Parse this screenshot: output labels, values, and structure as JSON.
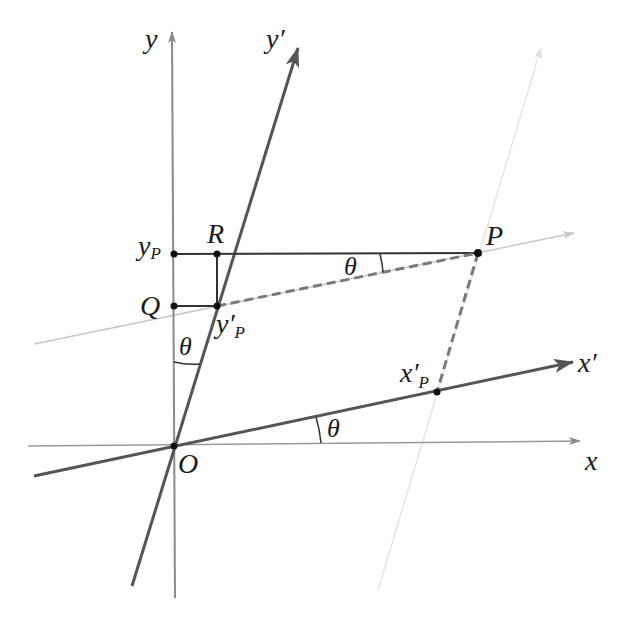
{
  "figure": {
    "colors": {
      "axis": "#8a8a8a",
      "rotated_axis": "#555555",
      "guide": "#c8c8c8",
      "faint_guide": "#e6e6e6",
      "construction": "#333333",
      "dashed": "#7a7a7a",
      "point": "#111111"
    },
    "labels": {
      "y": "y",
      "y_prime": "y′",
      "x": "x",
      "x_prime": "x′",
      "origin": "O",
      "P": "P",
      "Q": "Q",
      "R": "R",
      "y_P_main": "y",
      "y_P_sub": "P",
      "y_prime_P_main": "y′",
      "y_prime_P_sub": "P",
      "x_prime_P_main": "x′",
      "x_prime_P_sub": "P",
      "theta_top": "θ",
      "theta_left": "θ",
      "theta_bottom": "θ"
    },
    "angle_symbol": "θ"
  }
}
